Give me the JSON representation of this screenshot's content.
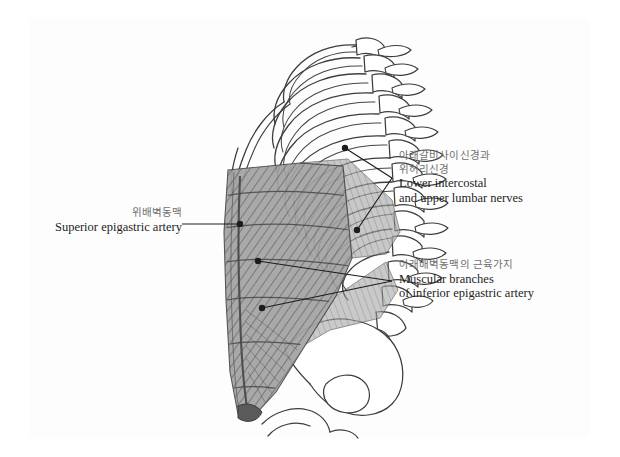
{
  "figure": {
    "title_visible": false,
    "view": "lateral view of trunk: rib cage, vertebral column, pelvis and abdominal wall musculature",
    "line_color": "#3a3a3a",
    "muscle_fill": "#9c9c9c",
    "muscle_hatch": "#5d5d5d",
    "bone_fill": "#ffffff",
    "korean_text_color": "#6f6f6f",
    "english_text_color": "#1d1d1d",
    "background": "#ffffff"
  },
  "labels": [
    {
      "id": "lower-intercostal-nerves",
      "korean": [
        "아래갈비사이신경과",
        "위허리신경"
      ],
      "english": [
        "Lower intercostal",
        "and upper lumbar nerves"
      ],
      "side": "right",
      "x": 399,
      "y": 149,
      "leader_apex": [
        392,
        178
      ],
      "leader_points": [
        [
          345,
          148
        ],
        [
          357,
          230
        ]
      ]
    },
    {
      "id": "superior-epigastric-artery",
      "korean": [
        "위배벽동맥"
      ],
      "english": [
        "Superior epigastric artery"
      ],
      "side": "left",
      "x": 63,
      "y": 206,
      "leader_apex": [
        240,
        224
      ],
      "leader_points": [
        [
          240,
          224
        ]
      ]
    },
    {
      "id": "muscular-branches-inferior-epigastric",
      "korean": [
        "아래배벽동맥의 근육가지"
      ],
      "english": [
        "Muscular branches",
        "of inferior epigastric artery"
      ],
      "side": "right",
      "x": 399,
      "y": 258,
      "leader_apex": [
        392,
        281
      ],
      "leader_points": [
        [
          258,
          261
        ],
        [
          262,
          308
        ]
      ]
    }
  ],
  "structures": {
    "ribs_count": 11,
    "vertebrae_count": 12,
    "parts": [
      "rib cage",
      "costal cartilage",
      "thoracic and lumbar vertebrae with spinous processes",
      "rectus abdominis with tendinous intersections",
      "external oblique",
      "ilium / pelvic bone",
      "pubic attachment"
    ]
  }
}
